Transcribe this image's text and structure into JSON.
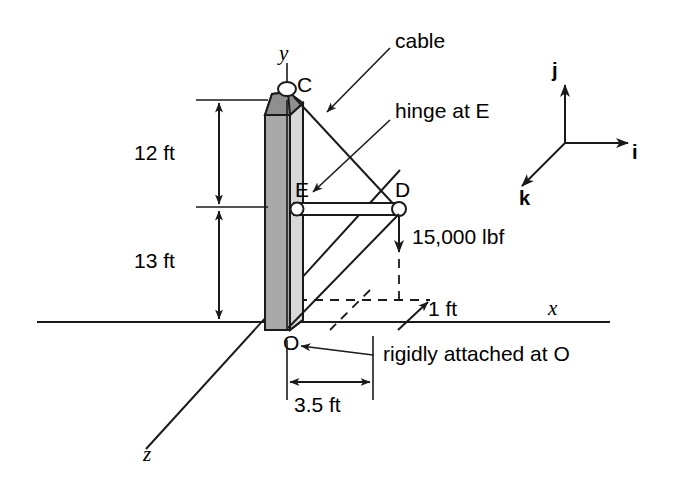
{
  "figure": {
    "axes": {
      "x_label": "x",
      "y_label": "y",
      "z_label": "z"
    },
    "points": {
      "C": "C",
      "D": "D",
      "E": "E",
      "O": "O"
    },
    "dimensions": {
      "upper": "12 ft",
      "lower": "13 ft",
      "offset": "1 ft",
      "base": "3.5 ft"
    },
    "loads": {
      "force": "15,000 lbf"
    },
    "annotations": {
      "cable": "cable",
      "hinge": "hinge at E",
      "support": "rigidly attached at O"
    },
    "unit_vectors": {
      "i": "i",
      "j": "j",
      "k": "k"
    },
    "colors": {
      "line": "#1a1a1a",
      "pole_front": "#a9a9a9",
      "pole_side": "#d8d8d8",
      "pole_top": "#8f8f8f",
      "background": "#ffffff"
    }
  }
}
